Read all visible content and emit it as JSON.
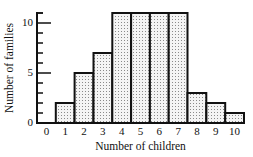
{
  "chart_data": {
    "type": "bar",
    "title": "",
    "xlabel": "Number of children",
    "ylabel": "Number of families",
    "categories": [
      "0",
      "1",
      "2",
      "3",
      "4",
      "5",
      "6",
      "7",
      "8",
      "9",
      "10"
    ],
    "values": [
      0,
      2,
      5,
      7,
      11,
      11,
      11,
      11,
      3,
      2,
      1
    ],
    "ylim": [
      0,
      11
    ],
    "y_ticks": [
      0,
      5,
      10
    ],
    "y_minor_ticks": [
      1,
      2,
      3,
      4,
      6,
      7,
      8,
      9
    ],
    "grid": false,
    "legend": null,
    "bar_style": "stippled fill with thick black outline, bars touching (histogram)"
  },
  "colors": {
    "outline": "#111111",
    "fill": "#f4f4f4",
    "stipple": "#8a8a8a",
    "background": "#ffffff"
  }
}
